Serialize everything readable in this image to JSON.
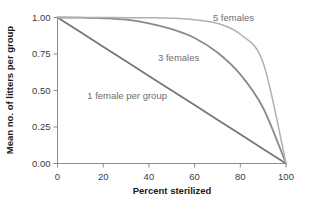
{
  "chart_data": {
    "type": "line",
    "title": "",
    "xlabel": "Percent sterilized",
    "ylabel": "Mean no. of litters per group",
    "xlim": [
      0,
      100
    ],
    "ylim": [
      0,
      1.0
    ],
    "grid": false,
    "legend_position": "inline-annotations",
    "xticks": [
      "0",
      "20",
      "40",
      "60",
      "80",
      "100"
    ],
    "xtick_values": [
      0,
      20,
      40,
      60,
      80,
      100
    ],
    "yticks": [
      "0.00",
      "0.25",
      "0.50",
      "0.75",
      "1.00"
    ],
    "ytick_values": [
      0.0,
      0.25,
      0.5,
      0.75,
      1.0
    ],
    "x": [
      0,
      10,
      20,
      30,
      40,
      50,
      60,
      70,
      80,
      90,
      100
    ],
    "series": [
      {
        "name": "1 female per group",
        "label": "1 female per group",
        "color": "#767676",
        "values": [
          1.0,
          0.9,
          0.8,
          0.7,
          0.6,
          0.5,
          0.4,
          0.3,
          0.2,
          0.1,
          0.0
        ]
      },
      {
        "name": "3 females",
        "label": "3 females",
        "color": "#8a8a8a",
        "values": [
          1.0,
          0.999,
          0.995,
          0.985,
          0.96,
          0.92,
          0.86,
          0.76,
          0.61,
          0.38,
          0.0
        ]
      },
      {
        "name": "5 females",
        "label": "5 females",
        "color": "#b0b0b0",
        "values": [
          1.0,
          1.0,
          1.0,
          0.999,
          0.998,
          0.995,
          0.985,
          0.96,
          0.885,
          0.69,
          0.0
        ]
      }
    ],
    "annotations": [
      {
        "text": "5 females",
        "x": 68,
        "y": 0.975,
        "color": "#8a8a8a"
      },
      {
        "text": "3 females",
        "x": 44,
        "y": 0.7,
        "color": "#8a8a8a"
      },
      {
        "text": "1 female per group",
        "x": 13,
        "y": 0.445,
        "color": "#8a8a8a"
      }
    ]
  }
}
